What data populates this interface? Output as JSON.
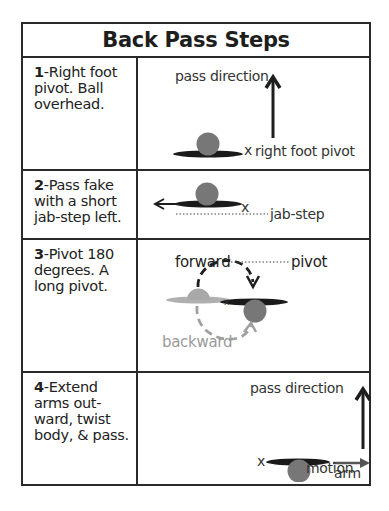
{
  "title": "Back Pass Steps",
  "steps": [
    {
      "number": "1",
      "text": "-Right foot pivot. Ball overhead.",
      "labels": {
        "pass_direction": "pass direction",
        "pivot_mark": "x",
        "pivot": "right foot pivot"
      }
    },
    {
      "number": "2",
      "text": "-Pass fake with a short jab-step left.",
      "labels": {
        "pivot_mark": "x",
        "jab_step": "jab-step"
      }
    },
    {
      "number": "3",
      "text": "-Pivot 180 degrees. A long pivot.",
      "labels": {
        "forward": "forward",
        "pivot": "pivot",
        "backward": "backward"
      }
    },
    {
      "number": "4",
      "text": "-Extend arms out-ward, twist body, & pass.",
      "labels": {
        "pass_direction": "pass direction",
        "pivot_mark": "x",
        "arm_motion_1": "arm",
        "arm_motion_2": "motion"
      }
    }
  ],
  "colors": {
    "border": "#2a2a2a",
    "ball": "#777777",
    "ball_light": "#a8a8a8",
    "body_shadow": "#1a1a1a",
    "body_shadow_light": "#b0b0b0",
    "arrow": "#1e1e1e",
    "backward_arrow": "#a0a0a0"
  }
}
